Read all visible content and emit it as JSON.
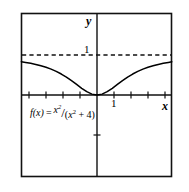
{
  "figure": {
    "kind": "cartesian-graph",
    "background_color": "#ffffff",
    "frame_color": "#000000"
  },
  "labels": {
    "y_axis": "y",
    "x_axis": "x",
    "y_tick_1": "1",
    "x_tick_1": "1"
  },
  "formula": {
    "function_name": "f(x)",
    "equals": "=",
    "numerator": "x",
    "numerator_exponent": "2",
    "slash": "/",
    "denominator_open": "(",
    "denominator_var": "x",
    "denominator_exponent": "2",
    "denominator_rest": " + 4)",
    "plain_text": "f(x) = x^2/(x^2 + 4)"
  },
  "chart_data": {
    "type": "line",
    "title": "",
    "xlabel": "x",
    "ylabel": "y",
    "expression": "f(x) = x^2/(x^2 + 4)",
    "xlim": [
      -4.45,
      4.4
    ],
    "ylim": [
      -2.05,
      2.05
    ],
    "grid": false,
    "legend": null,
    "origin_px": [
      97,
      95
    ],
    "unit_px": {
      "x": 17,
      "y": 40
    },
    "x_ticks": [
      -4,
      -3,
      -2,
      -1,
      1,
      2,
      3,
      4
    ],
    "x_tick_labels": {
      "1": "1"
    },
    "y_ticks": [
      -1
    ],
    "y_tick_labels": {
      "1": "1"
    },
    "asymptote": {
      "value": 1,
      "style": "dashed",
      "label": "1",
      "orientation": "horizontal"
    },
    "series": [
      {
        "name": "f(x) = x^2/(x^2 + 4)",
        "style": "solid",
        "color": "#000000",
        "x": [
          -4.45,
          -4.2,
          -3.9,
          -3.6,
          -3.3,
          -3.0,
          -2.7,
          -2.4,
          -2.1,
          -1.8,
          -1.5,
          -1.2,
          -0.9,
          -0.6,
          -0.3,
          0.0,
          0.3,
          0.6,
          0.9,
          1.2,
          1.5,
          1.8,
          2.1,
          2.4,
          2.7,
          3.0,
          3.3,
          3.6,
          3.9,
          4.2,
          4.4
        ],
        "y": [
          0.832,
          0.815,
          0.792,
          0.764,
          0.731,
          0.692,
          0.646,
          0.59,
          0.524,
          0.448,
          0.36,
          0.265,
          0.168,
          0.083,
          0.022,
          0.0,
          0.022,
          0.083,
          0.168,
          0.265,
          0.36,
          0.448,
          0.524,
          0.59,
          0.646,
          0.692,
          0.731,
          0.764,
          0.792,
          0.815,
          0.829
        ]
      }
    ]
  }
}
